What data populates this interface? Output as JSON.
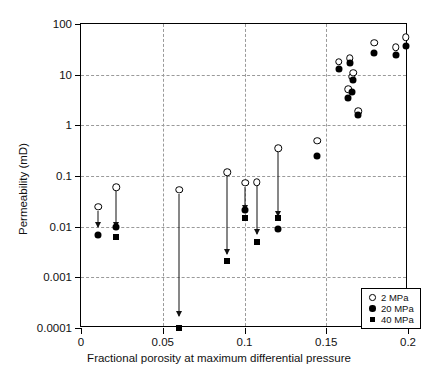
{
  "chart_data": {
    "type": "scatter",
    "title": "",
    "xlabel": "Fractional porosity at maximum differential pressure",
    "ylabel": "Permeability (mD)",
    "xlim": [
      0,
      0.2
    ],
    "ylim": [
      0.0001,
      100
    ],
    "yscale": "log",
    "grid": true,
    "legend_position": "bottom-right",
    "xticks": [
      "0",
      "0.05",
      "0.1",
      "0.15",
      "0.2"
    ],
    "xtick_values": [
      0,
      0.05,
      0.1,
      0.15,
      0.2
    ],
    "yticks": [
      "100",
      "10",
      "1",
      "0.1",
      "0.01",
      "0.001",
      "0.0001"
    ],
    "ytick_values": [
      100,
      10,
      1,
      0.1,
      0.01,
      0.001,
      0.0001
    ],
    "series": [
      {
        "name": "2 MPa",
        "marker": "open-circle",
        "color": "#000000",
        "points": [
          {
            "x": 0.0105,
            "y": 0.025
          },
          {
            "x": 0.0215,
            "y": 0.06
          },
          {
            "x": 0.06,
            "y": 0.054
          },
          {
            "x": 0.0895,
            "y": 0.118
          },
          {
            "x": 0.1005,
            "y": 0.074
          },
          {
            "x": 0.1075,
            "y": 0.075
          },
          {
            "x": 0.1205,
            "y": 0.35
          },
          {
            "x": 0.1445,
            "y": 0.5
          },
          {
            "x": 0.1575,
            "y": 18
          },
          {
            "x": 0.1635,
            "y": 5.2
          },
          {
            "x": 0.1645,
            "y": 21
          },
          {
            "x": 0.1655,
            "y": 9.0
          },
          {
            "x": 0.1665,
            "y": 11
          },
          {
            "x": 0.1695,
            "y": 1.9
          },
          {
            "x": 0.1795,
            "y": 43
          },
          {
            "x": 0.1925,
            "y": 35
          },
          {
            "x": 0.1985,
            "y": 55
          }
        ]
      },
      {
        "name": "20 MPa",
        "marker": "filled-circle",
        "color": "#000000",
        "points": [
          {
            "x": 0.0105,
            "y": 0.0068
          },
          {
            "x": 0.0215,
            "y": 0.01
          },
          {
            "x": 0.1005,
            "y": 0.021
          },
          {
            "x": 0.1205,
            "y": 0.0092
          },
          {
            "x": 0.1445,
            "y": 0.25
          },
          {
            "x": 0.1575,
            "y": 13
          },
          {
            "x": 0.1635,
            "y": 3.4
          },
          {
            "x": 0.1645,
            "y": 17
          },
          {
            "x": 0.1655,
            "y": 4.6
          },
          {
            "x": 0.1665,
            "y": 7.9
          },
          {
            "x": 0.1695,
            "y": 1.6
          },
          {
            "x": 0.1795,
            "y": 27
          },
          {
            "x": 0.1925,
            "y": 25
          },
          {
            "x": 0.1985,
            "y": 37
          }
        ]
      },
      {
        "name": "40 MPa",
        "marker": "filled-square",
        "color": "#000000",
        "points": [
          {
            "x": 0.0215,
            "y": 0.0063
          },
          {
            "x": 0.06,
            "y": 0.0001
          },
          {
            "x": 0.0895,
            "y": 0.0021
          },
          {
            "x": 0.1005,
            "y": 0.015
          },
          {
            "x": 0.1075,
            "y": 0.0049
          },
          {
            "x": 0.1205,
            "y": 0.015
          }
        ]
      }
    ],
    "arrows": [
      {
        "x": 0.0105,
        "y_from": 0.025,
        "y_to": 0.0098
      },
      {
        "x": 0.0215,
        "y_from": 0.06,
        "y_to": 0.0098
      },
      {
        "x": 0.06,
        "y_from": 0.054,
        "y_to": 0.00017
      },
      {
        "x": 0.0895,
        "y_from": 0.118,
        "y_to": 0.0029
      },
      {
        "x": 0.1005,
        "y_from": 0.074,
        "y_to": 0.0215
      },
      {
        "x": 0.1075,
        "y_from": 0.075,
        "y_to": 0.0073
      },
      {
        "x": 0.1205,
        "y_from": 0.35,
        "y_to": 0.0165
      }
    ]
  },
  "legend": {
    "entries": [
      {
        "symbol": "open-circle",
        "label": "2 MPa"
      },
      {
        "symbol": "filled-circle",
        "label": "20 MPa"
      },
      {
        "symbol": "filled-square",
        "label": "40 MPa"
      }
    ]
  }
}
